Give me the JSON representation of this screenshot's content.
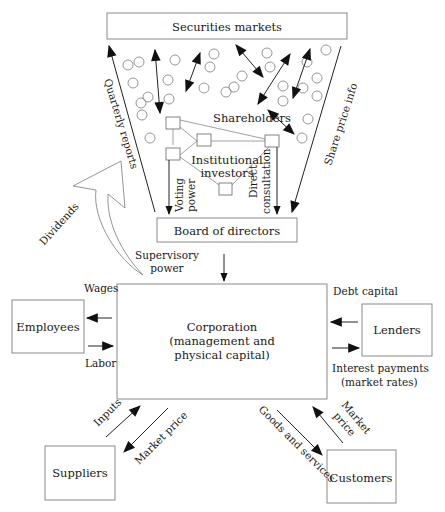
{
  "diagram": {
    "nodes": {
      "securities_markets": "Securities markets",
      "shareholders": "Shareholders",
      "institutional_investors_line1": "Institutional",
      "institutional_investors_line2": "investors",
      "board_of_directors": "Board of directors",
      "corporation_line1": "Corporation",
      "corporation_line2": "(management and",
      "corporation_line3": "physical capital)",
      "employees": "Employees",
      "lenders": "Lenders",
      "suppliers": "Suppliers",
      "customers": "Customers"
    },
    "edges": {
      "quarterly_reports": "Quarterly reports",
      "share_price_info": "Share price info",
      "voting_power_line1": "Voting",
      "voting_power_line2": "power",
      "direct_consultation_line1": "Direct",
      "direct_consultation_line2": "consultation",
      "dividends": "Dividends",
      "supervisory_power_line1": "Supervisory",
      "supervisory_power_line2": "power",
      "wages": "Wages",
      "labor": "Labor",
      "debt_capital": "Debt capital",
      "interest_payments_line1": "Interest payments",
      "interest_payments_line2": "(market rates)",
      "inputs": "Inputs",
      "supplier_market_price": "Market price",
      "goods_and_services": "Goods and services",
      "customer_market_price_line1": "Market",
      "customer_market_price_line2": "price"
    },
    "colors": {
      "line": "#222222",
      "box_border": "#8a8a8a",
      "background": "#ffffff"
    }
  }
}
